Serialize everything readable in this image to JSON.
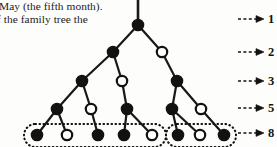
{
  "page_text": {
    "line_1": "May (the fifth month).",
    "line_2": "f the family tree the"
  },
  "diagram": {
    "colors": {
      "ink": "#141211",
      "node_fill_male": "#ffffff",
      "node_fill_female": "#141211",
      "edge": "#1a1817",
      "grouping_outline": "#141211",
      "page_background": "#fdfdfc"
    },
    "legend": {
      "filled_meaning": "female (two parents)",
      "open_meaning": "male (one parent)"
    },
    "generation_labels": [
      {
        "value": "1",
        "y": 19
      },
      {
        "value": "2",
        "y": 52
      },
      {
        "value": "3",
        "y": 81
      },
      {
        "value": "5",
        "y": 108
      },
      {
        "value": "8",
        "y": 133
      }
    ],
    "arrow": {
      "dash_start_x": 238,
      "dash_end_x": 256,
      "tip_x": 264,
      "label_x": 268
    },
    "rows": [
      {
        "generation": 1,
        "count": 1,
        "y": 25,
        "nodes": [
          {
            "id": "n1a",
            "x": 138,
            "type": "filled"
          }
        ]
      },
      {
        "generation": 2,
        "count": 2,
        "y": 52,
        "nodes": [
          {
            "id": "n2a",
            "x": 113,
            "type": "filled"
          },
          {
            "id": "n2b",
            "x": 162,
            "type": "open"
          }
        ]
      },
      {
        "generation": 3,
        "count": 3,
        "y": 81,
        "nodes": [
          {
            "id": "n3a",
            "x": 82,
            "type": "filled"
          },
          {
            "id": "n3b",
            "x": 122,
            "type": "open"
          },
          {
            "id": "n3c",
            "x": 177,
            "type": "filled"
          }
        ]
      },
      {
        "generation": 5,
        "count": 5,
        "y": 109,
        "nodes": [
          {
            "id": "n4a",
            "x": 57,
            "type": "filled"
          },
          {
            "id": "n4b",
            "x": 91,
            "type": "open"
          },
          {
            "id": "n4c",
            "x": 127,
            "type": "filled"
          },
          {
            "id": "n4d",
            "x": 172,
            "type": "filled"
          },
          {
            "id": "n4e",
            "x": 201,
            "type": "open"
          }
        ]
      },
      {
        "generation": 8,
        "count": 8,
        "y": 135,
        "nodes": [
          {
            "id": "n5a",
            "x": 37,
            "type": "filled"
          },
          {
            "id": "n5b",
            "x": 67,
            "type": "open"
          },
          {
            "id": "n5c",
            "x": 98,
            "type": "filled"
          },
          {
            "id": "n5d",
            "x": 124,
            "type": "filled"
          },
          {
            "id": "n5e",
            "x": 152,
            "type": "open"
          },
          {
            "id": "n5f",
            "x": 178,
            "type": "filled"
          },
          {
            "id": "n5g",
            "x": 200,
            "type": "open"
          },
          {
            "id": "n5h",
            "x": 224,
            "type": "filled"
          }
        ]
      }
    ],
    "edges": [
      {
        "from": "root-stem-top",
        "to": "n1a"
      },
      {
        "from": "n1a",
        "to": "n2a"
      },
      {
        "from": "n1a",
        "to": "n2b"
      },
      {
        "from": "n2a",
        "to": "n3a"
      },
      {
        "from": "n2a",
        "to": "n3b"
      },
      {
        "from": "n2b",
        "to": "n3c"
      },
      {
        "from": "n3a",
        "to": "n4a"
      },
      {
        "from": "n3a",
        "to": "n4b"
      },
      {
        "from": "n3b",
        "to": "n4c"
      },
      {
        "from": "n3c",
        "to": "n4d"
      },
      {
        "from": "n3c",
        "to": "n4e"
      },
      {
        "from": "n4a",
        "to": "n5a"
      },
      {
        "from": "n4a",
        "to": "n5b"
      },
      {
        "from": "n4b",
        "to": "n5c"
      },
      {
        "from": "n4c",
        "to": "n5d"
      },
      {
        "from": "n4c",
        "to": "n5e"
      },
      {
        "from": "n4d",
        "to": "n5f"
      },
      {
        "from": "n4d",
        "to": "n5g"
      },
      {
        "from": "n4e",
        "to": "n5h"
      }
    ],
    "groupings": [
      {
        "id": "group-left",
        "x": 24,
        "y": 124,
        "width": 142,
        "height": 23,
        "label": "five descendants"
      },
      {
        "id": "group-right",
        "x": 166,
        "y": 124,
        "width": 70,
        "height": 23,
        "label": "three descendants"
      }
    ],
    "node_radius_filled": 5.6,
    "node_radius_open": 5.2,
    "stem": {
      "x": 138,
      "y_top": 0,
      "y_bottom": 20
    }
  }
}
